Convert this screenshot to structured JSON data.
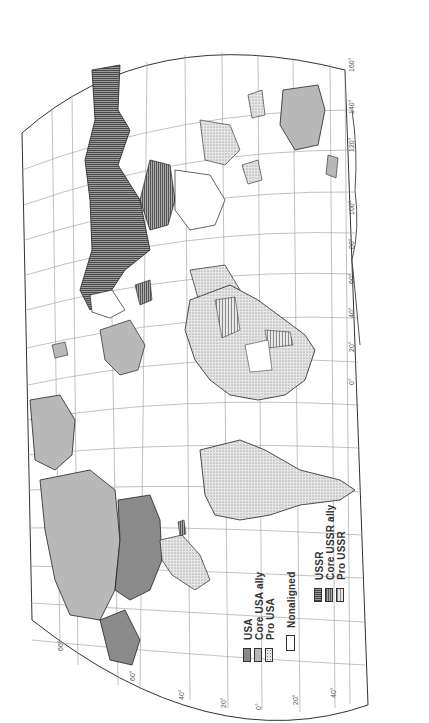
{
  "map": {
    "orientation": "rotated 90° counter-clockwise (north to the left)",
    "projection_frame": "curved graticule, 20° spacing"
  },
  "legend": {
    "groups": [
      {
        "items": [
          {
            "label": "USA",
            "fill": "#8a8a8a",
            "pattern": "solid"
          },
          {
            "label": "Core USA ally",
            "fill": "#b8b8b8",
            "pattern": "solid"
          },
          {
            "label": "Pro USA",
            "fill": "#dcdcdc",
            "pattern": "dots"
          }
        ]
      },
      {
        "items": [
          {
            "label": "Nonaligned",
            "fill": "#ffffff",
            "pattern": "none"
          }
        ]
      },
      {
        "items": [
          {
            "label": "USSR",
            "fill": "#555555",
            "pattern": "horizontal-lines"
          },
          {
            "label": "Core USSR ally",
            "fill": "#888888",
            "pattern": "vertical-lines"
          },
          {
            "label": "Pro USSR",
            "fill": "#bbbbbb",
            "pattern": "vertical-lines-light"
          }
        ]
      }
    ]
  },
  "graticule": {
    "longitude_labels_right": [
      "160°",
      "140°",
      "120°",
      "100°",
      "80°",
      "60°",
      "40°",
      "20°",
      "0°"
    ],
    "longitude_labels_bottom": [
      "20°",
      "40°",
      "60°",
      "80°",
      "100°",
      "120°",
      "140°",
      "160°",
      "180°"
    ],
    "latitude_labels_bottom": [
      "60°",
      "40°",
      "20°",
      "0°",
      "20°",
      "40°"
    ],
    "bottom_left_label": "60°"
  },
  "regions": {
    "ussr": "USSR",
    "north_america": "USA / Core USA ally",
    "south_america": "Pro USA",
    "africa": "Pro USA / Nonaligned / Pro USSR mix",
    "greenland": "Core USA ally",
    "australia": "Core USA ally",
    "china": "Core USSR ally",
    "india": "Nonaligned"
  }
}
